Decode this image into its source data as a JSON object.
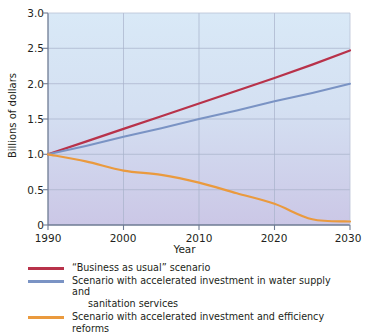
{
  "chart_data": {
    "type": "line",
    "title": "",
    "xlabel": "Year",
    "ylabel": "Billions of dollars",
    "xlim": [
      1990,
      2030
    ],
    "ylim": [
      0,
      3.0
    ],
    "grid": true,
    "legend_position": "below",
    "x_ticks": [
      "1990",
      "2000",
      "2010",
      "2020",
      "2030"
    ],
    "x_tick_values": [
      1990,
      2000,
      2010,
      2020,
      2030
    ],
    "y_ticks": [
      "0",
      "0.5",
      "1.0",
      "1.5",
      "2.0",
      "2.5",
      "3.0"
    ],
    "y_tick_values": [
      0,
      0.5,
      1.0,
      1.5,
      2.0,
      2.5,
      3.0
    ],
    "x": [
      1990,
      1995,
      2000,
      2005,
      2010,
      2015,
      2020,
      2025,
      2030
    ],
    "series": [
      {
        "name": "“Business as usual” scenario",
        "color": "#b8324a",
        "values": [
          1.0,
          1.18,
          1.36,
          1.54,
          1.72,
          1.9,
          2.08,
          2.27,
          2.47
        ]
      },
      {
        "name": "Scenario with accelerated investment in water supply and sanitation services",
        "color": "#7a93c4",
        "values": [
          1.0,
          1.12,
          1.25,
          1.37,
          1.5,
          1.62,
          1.75,
          1.87,
          2.0
        ]
      },
      {
        "name": "Scenario with accelerated investment and efficiency reforms",
        "color": "#ea9a3e",
        "values": [
          1.0,
          0.9,
          0.77,
          0.71,
          0.6,
          0.45,
          0.3,
          0.08,
          0.05
        ]
      }
    ]
  },
  "axes": {
    "x_title": "Year",
    "y_title": "Billions of dollars",
    "x_tick_labels": [
      "1990",
      "2000",
      "2010",
      "2020",
      "2030"
    ],
    "y_tick_labels": [
      "3.0",
      "2.5",
      "2.0",
      "1.5",
      "1.0",
      "0.5",
      "0"
    ]
  },
  "legend": {
    "items": [
      {
        "color": "#b8324a",
        "line1": "“Business as usual” scenario",
        "line2": ""
      },
      {
        "color": "#7a93c4",
        "line1": "Scenario with accelerated investment in water supply and",
        "line2": "sanitation services"
      },
      {
        "color": "#ea9a3e",
        "line1": "Scenario with accelerated investment and efficiency reforms",
        "line2": ""
      }
    ]
  },
  "colors": {
    "business_as_usual": "#b8324a",
    "accelerated_investment": "#7a93c4",
    "efficiency_reforms": "#ea9a3e",
    "plot_bg_top": "#d7e7f6",
    "plot_bg_bottom": "#cbc7e6",
    "grid": "#a9b4cc",
    "axis": "#6e7b93",
    "text": "#231f20"
  }
}
